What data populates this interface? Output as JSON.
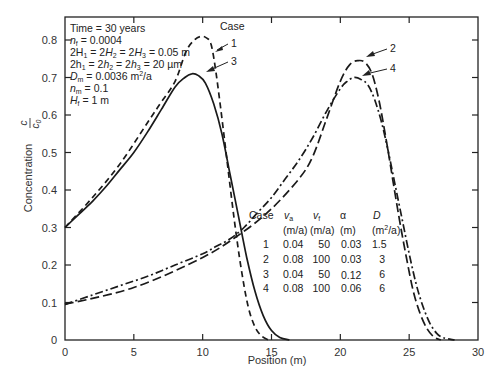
{
  "chart_data": {
    "type": "line",
    "title": "",
    "xlabel": "Position (m)",
    "ylabel": "Concentration c/c0",
    "xlim": [
      0,
      30
    ],
    "ylim": [
      0,
      0.85
    ],
    "xticks": [
      0,
      5,
      10,
      15,
      20,
      25,
      30
    ],
    "yticks": [
      0,
      0.1,
      0.2,
      0.3,
      0.4,
      0.5,
      0.6,
      0.7,
      0.8
    ],
    "grid": false,
    "legend_title": "Case",
    "series": [
      {
        "name": "1",
        "style": "dashed",
        "x": [
          0,
          2,
          4,
          6,
          7,
          8,
          8.8,
          9.4,
          9.9,
          10.3,
          10.6,
          10.9,
          11.3,
          11.8,
          12.3,
          12.8,
          13.3,
          13.8,
          14.3,
          14.8
        ],
        "y": [
          0.3,
          0.38,
          0.47,
          0.58,
          0.635,
          0.69,
          0.77,
          0.8,
          0.81,
          0.805,
          0.79,
          0.73,
          0.62,
          0.47,
          0.32,
          0.19,
          0.09,
          0.035,
          0.01,
          0.0
        ]
      },
      {
        "name": "2",
        "style": "long-dash",
        "x": [
          0,
          5,
          10,
          13,
          15,
          17,
          18,
          19,
          20,
          20.7,
          21.3,
          21.8,
          22.3,
          22.8,
          23.3,
          23.8,
          24.3,
          24.8,
          25.3,
          25.8,
          26.3,
          26.8,
          27.3
        ],
        "y": [
          0.095,
          0.14,
          0.22,
          0.29,
          0.35,
          0.43,
          0.49,
          0.59,
          0.69,
          0.735,
          0.745,
          0.74,
          0.71,
          0.64,
          0.54,
          0.43,
          0.32,
          0.22,
          0.13,
          0.07,
          0.03,
          0.008,
          0.0
        ]
      },
      {
        "name": "3",
        "style": "solid",
        "x": [
          0,
          1,
          2,
          3,
          4,
          5,
          6,
          7,
          8,
          8.7,
          9.2,
          9.7,
          10.2,
          10.8,
          11.4,
          12,
          12.6,
          13.2,
          13.8,
          14.4,
          15,
          15.6,
          16.3
        ],
        "y": [
          0.3,
          0.335,
          0.37,
          0.41,
          0.455,
          0.5,
          0.555,
          0.615,
          0.675,
          0.7,
          0.71,
          0.705,
          0.685,
          0.63,
          0.55,
          0.44,
          0.33,
          0.22,
          0.13,
          0.065,
          0.025,
          0.007,
          0.0
        ]
      },
      {
        "name": "4",
        "style": "dash-dot",
        "x": [
          0,
          2,
          4,
          6,
          8,
          10,
          11,
          12,
          13,
          14,
          15,
          16,
          17,
          18,
          19,
          20,
          20.5,
          21,
          21.5,
          22,
          22.5,
          23,
          23.5,
          24,
          24.5,
          25,
          25.5,
          26,
          26.5,
          27,
          27.5,
          28.3
        ],
        "y": [
          0.095,
          0.12,
          0.145,
          0.17,
          0.2,
          0.23,
          0.25,
          0.27,
          0.3,
          0.34,
          0.38,
          0.43,
          0.48,
          0.54,
          0.61,
          0.67,
          0.69,
          0.7,
          0.695,
          0.68,
          0.64,
          0.58,
          0.5,
          0.41,
          0.32,
          0.23,
          0.15,
          0.09,
          0.045,
          0.018,
          0.006,
          0.0
        ]
      }
    ],
    "annotations": [
      "Time = 30 years",
      "n_f = 0.0004",
      "2H1 = 2H2 = 2H3 = 0.05 m",
      "2h1 = 2h2 = 2h3 = 20 µm",
      "Dm = 0.0036 m²/a",
      "nm = 0.1",
      "Hf = 1 m"
    ],
    "table": {
      "headers": [
        "Case",
        "va",
        "vf",
        "α",
        "D"
      ],
      "units": [
        "",
        "(m/a)",
        "(m/a)",
        "(m)",
        "(m²/a)"
      ],
      "rows": [
        [
          "1",
          "0.04",
          "50",
          "0.03",
          "1.5"
        ],
        [
          "2",
          "0.08",
          "100",
          "0.03",
          "3"
        ],
        [
          "3",
          "0.04",
          "50",
          "0.12",
          "6"
        ],
        [
          "4",
          "0.08",
          "100",
          "0.06",
          "6"
        ]
      ]
    }
  },
  "labels": {
    "xlabel": "Position (m)",
    "ylabel": "Concentration",
    "ylabel_frac_num": "c",
    "ylabel_frac_den": "c",
    "ylabel_frac_den_sub": "0",
    "case_header": "Case",
    "case1": "1",
    "case2": "2",
    "case3": "3",
    "case4": "4",
    "xticks": [
      "0",
      "5",
      "10",
      "15",
      "20",
      "25",
      "30"
    ],
    "yticks": [
      "0",
      "0.1",
      "0.2",
      "0.3",
      "0.4",
      "0.5",
      "0.6",
      "0.7",
      "0.8"
    ]
  },
  "params": {
    "time": "Time = 30 years",
    "nf_pre": "n",
    "nf_sub": "f",
    "nf_val": " = 0.0004",
    "H_line": "2H",
    "h_line": "2h",
    "Dm_pre": "D",
    "Dm_sub": "m",
    "Dm_val": " = 0.0036 m",
    "Dm_sup": "2",
    "Dm_tail": "/a",
    "nm_pre": "n",
    "nm_sub": "m",
    "nm_val": " = 0.1",
    "Hf_pre": "H",
    "Hf_sub": "f",
    "Hf_val": " = 1 m",
    "H_eq": " = 2",
    "H_val": " = 0.05 m",
    "h_val": " = 20 µm",
    "sub1": "1",
    "sub2": "2",
    "sub3": "3"
  },
  "table": {
    "h_case": "Case",
    "h_va": "v",
    "h_va_sub": "a",
    "h_vf": "v",
    "h_vf_sub": "f",
    "h_alpha": "α",
    "h_D": "D",
    "u_va": "(m/a)",
    "u_vf": "(m/a)",
    "u_alpha": "(m)",
    "u_D_pre": "(m",
    "u_D_sup": "2",
    "u_D_post": "/a)",
    "rows": [
      {
        "case": "1",
        "va": "0.04",
        "vf": "50",
        "alpha": "0.03",
        "D": "1.5"
      },
      {
        "case": "2",
        "va": "0.08",
        "vf": "100",
        "alpha": "0.03",
        "D": "3"
      },
      {
        "case": "3",
        "va": "0.04",
        "vf": "50",
        "alpha": "0.12",
        "D": "6"
      },
      {
        "case": "4",
        "va": "0.08",
        "vf": "100",
        "alpha": "0.06",
        "D": "6"
      }
    ]
  }
}
